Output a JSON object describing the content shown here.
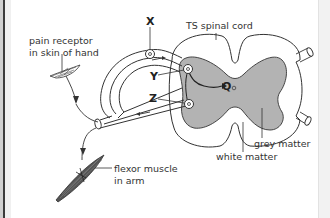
{
  "diagram": {
    "type": "reflex-arc",
    "labels": {
      "x": "X",
      "y": "Y",
      "z": "Z",
      "q": "Q",
      "ts_spinal_cord": "TS spinal cord",
      "pain_receptor_line1": "pain receptor",
      "pain_receptor_line2": "in skin of hand",
      "flexor_line1": "flexor muscle",
      "flexor_line2": "in arm",
      "grey_matter": "grey matter",
      "white_matter": "white matter"
    },
    "colors": {
      "grey_matter_fill": "#b3b3b3",
      "line": "#333333",
      "muscle": "#555555"
    }
  }
}
